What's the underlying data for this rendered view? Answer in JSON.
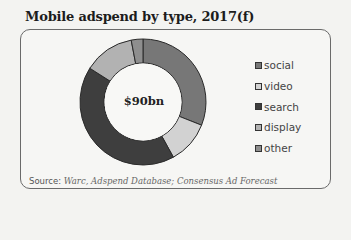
{
  "title": "Mobile adspend by type, 2017(f)",
  "center_label": "$90bn",
  "legend": [
    {
      "label": "social",
      "color": "#777777"
    },
    {
      "label": "video",
      "color": "#d2d2d2"
    },
    {
      "label": "search",
      "color": "#3e3e3e"
    },
    {
      "label": "display",
      "color": "#b2b2b2"
    },
    {
      "label": "other",
      "color": "#8e8e8e"
    }
  ],
  "source": {
    "label": "Source:",
    "text": "Warc, Adspend Database; Consensus Ad Forecast"
  },
  "chart_data": {
    "type": "pie",
    "subtype": "donut",
    "title": "Mobile adspend by type, 2017(f)",
    "center_label": "$90bn",
    "categories": [
      "social",
      "video",
      "search",
      "display",
      "other"
    ],
    "values": [
      31,
      11,
      42,
      13,
      3
    ],
    "unit": "% of total (estimated from segment angles)",
    "total": "$90bn",
    "legend_position": "right",
    "source": "Warc, Adspend Database; Consensus Ad Forecast"
  }
}
